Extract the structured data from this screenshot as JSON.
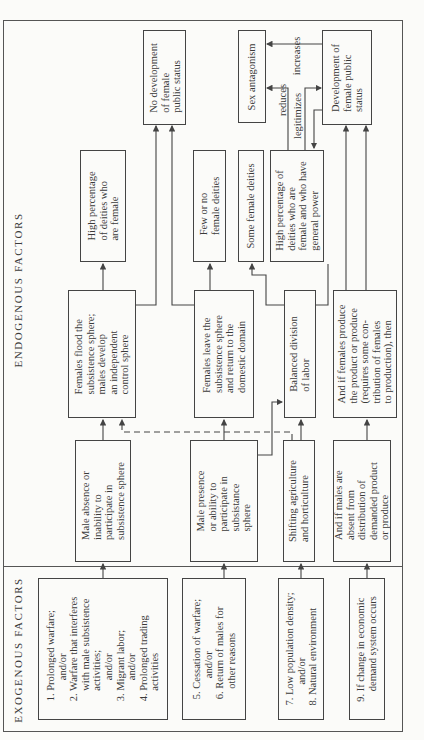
{
  "headers": {
    "endogenous": "ENDOGENOUS FACTORS",
    "exogenous": "EXOGENOUS FACTORS"
  },
  "exogenous": {
    "box1": "1. Prolonged warfare;\n        and/or\n2. Warfare that interferes\n    with male subsistence\n    activities;\n        and/or\n3. Migrant labor;\n        and/or\n4. Prolonged trading\n    activities",
    "box2": "5. Cessation of warfare;\n        and/or\n6. Return of males for\n    other reasons",
    "box3": "7. Low population density;\n        and/or\n8. Natural environment",
    "box4": "9. If change in economic\n    demand system occurs"
  },
  "conditions": {
    "male_absence": "Male absence or\ninability to\nparticipate in\nsubsistence sphere",
    "male_presence": "Male presence\nor ability to\nparticipate in\nsubsistance\nsphere",
    "shifting": "Shifting agriculture\nand horticulture",
    "males_absent": "And if males are\nabsent from\ndistribution of\ndemanded product\nor produce"
  },
  "outcomes": {
    "females_flood": "Females flood the\nsubsistence sphere;\nmales develop\nan independent\ncontrol sphere",
    "females_leave": "Females leave the\nsubsistence sphere\nand return to the\ndomestic domain",
    "balanced": "Balanced division\nof labor",
    "females_produce": "And if females produce\nthe product or produce\n(requires some con-\ntribution of females\nto production), then"
  },
  "deities": {
    "high_pct": "High percentage\nof deities who\nare female",
    "few_or_no": "Few or no\nfemale deities",
    "some": "Some female deities",
    "high_pct_power": "High percentage of\ndeities who are\nfemale and who have\ngeneral power"
  },
  "status": {
    "no_development": "No development\nof female\npublic status",
    "sex_antagonism": "Sex antagonism",
    "development": "Development of\nfemale public\nstatus"
  },
  "edge_labels": {
    "increases": "increases",
    "reduces": "reduces",
    "legitimizes": "legitimizes"
  }
}
